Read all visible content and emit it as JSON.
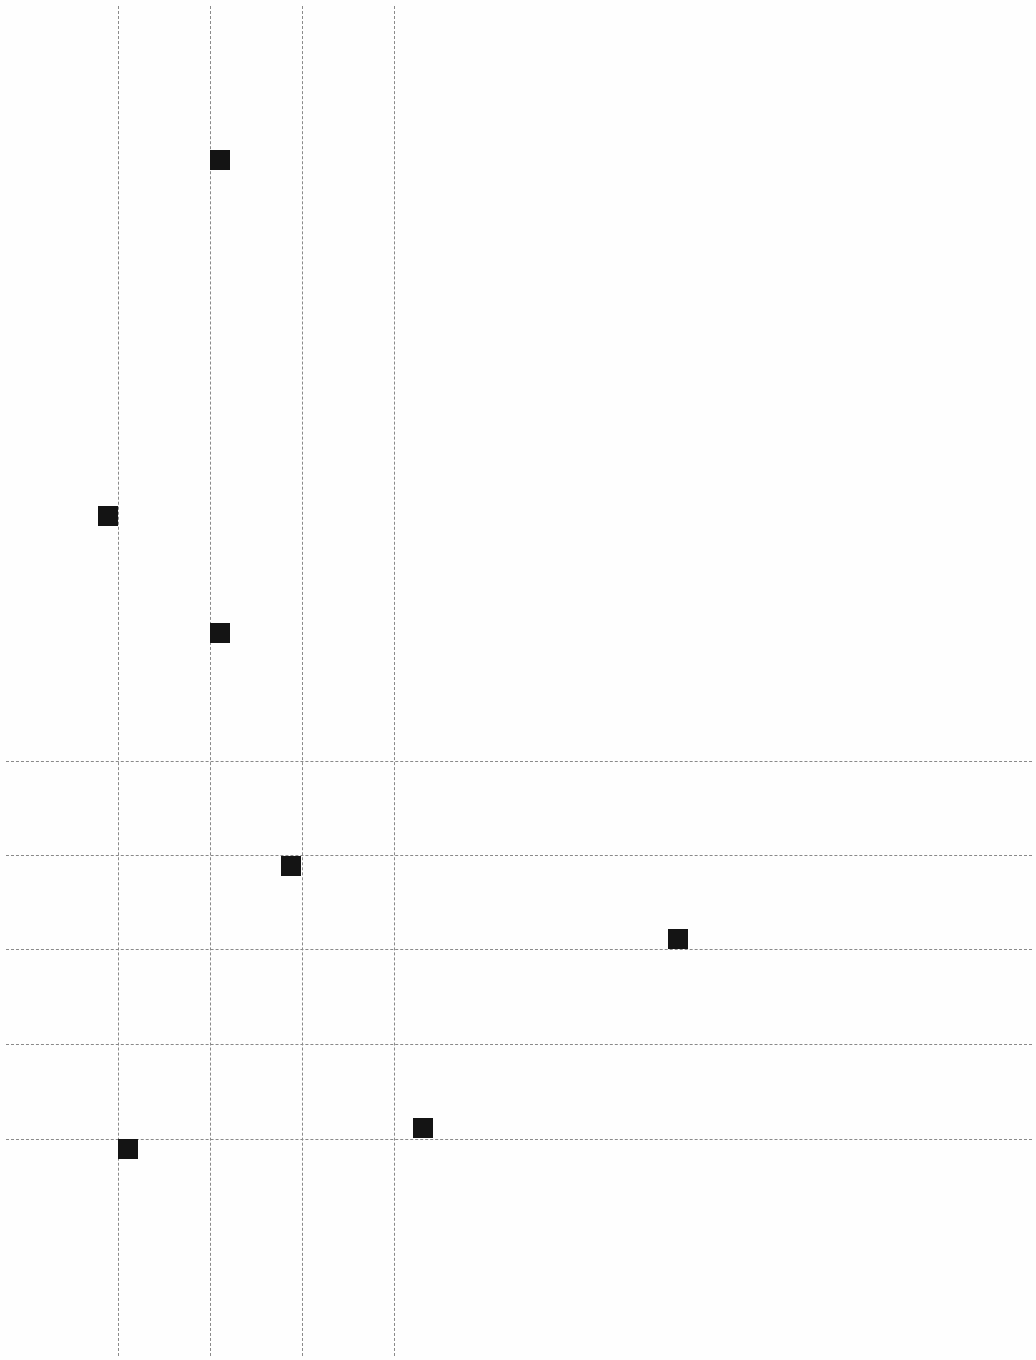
{
  "chart_data": {
    "type": "scatter",
    "title": "",
    "xlabel": "",
    "ylabel": "",
    "grid": true,
    "grid_style": "dashed",
    "marker": "square",
    "marker_color": "#141414",
    "grid_color": "#8a8a8a",
    "vertical_gridlines_px": [
      118,
      210,
      302,
      394
    ],
    "horizontal_gridlines_px": [
      761,
      855,
      949,
      1044,
      1139
    ],
    "points_px": [
      {
        "x": 210,
        "y": 150
      },
      {
        "x": 98,
        "y": 506
      },
      {
        "x": 210,
        "y": 623
      },
      {
        "x": 281,
        "y": 856
      },
      {
        "x": 668,
        "y": 929
      },
      {
        "x": 413,
        "y": 1118
      },
      {
        "x": 118,
        "y": 1139
      }
    ]
  }
}
